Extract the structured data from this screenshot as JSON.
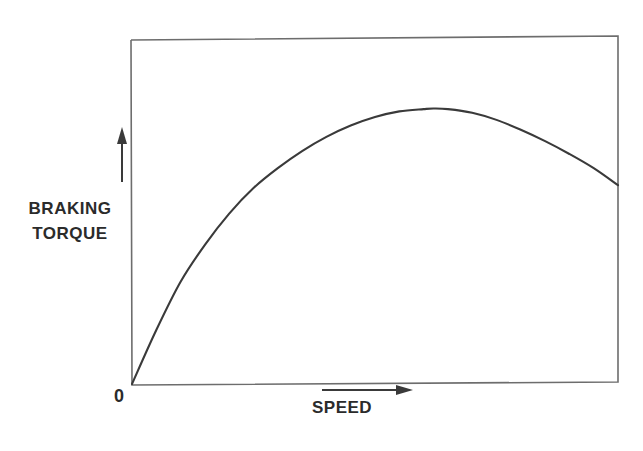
{
  "figure": {
    "background_color": "#ffffff",
    "ink_color": "#3a3a3a",
    "text_color": "#2b2b2b"
  },
  "labels": {
    "y_axis_line1": "BRAKING",
    "y_axis_line2": "TORQUE",
    "x_axis": "SPEED",
    "origin": "0"
  },
  "chart_data": {
    "type": "line",
    "title": "",
    "xlabel": "SPEED",
    "ylabel": "BRAKING TORQUE",
    "subtitle": "",
    "grid": false,
    "legend": null,
    "axis_style": "qualitative-arrows",
    "origin_tick_label": "0",
    "xlim": [
      0,
      100
    ],
    "ylim": [
      0,
      100
    ],
    "x_tick_labels": [],
    "y_tick_labels": [],
    "annotations": [
      {
        "name": "y-axis-direction-arrow",
        "direction": "up"
      },
      {
        "name": "x-axis-direction-arrow",
        "direction": "right"
      }
    ],
    "series": [
      {
        "name": "Braking torque curve",
        "x": [
          0,
          5,
          10,
          15,
          20,
          25,
          30,
          35,
          40,
          45,
          50,
          55,
          60,
          62,
          65,
          70,
          75,
          80,
          85,
          90,
          95,
          100
        ],
        "y": [
          0,
          19,
          36,
          49,
          60,
          69,
          76,
          82,
          87,
          91,
          94,
          96,
          96.8,
          97,
          96.8,
          95.5,
          93,
          89.5,
          85.5,
          81,
          76,
          70
        ]
      }
    ]
  }
}
